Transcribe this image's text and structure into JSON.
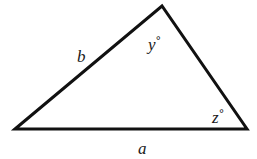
{
  "diagram": {
    "type": "triangle",
    "vertices": {
      "left": [
        15,
        129
      ],
      "top": [
        162,
        6
      ],
      "right": [
        247,
        129
      ]
    },
    "stroke_color": "#111111",
    "sides": {
      "a": {
        "label": "a",
        "position": "bottom"
      },
      "b": {
        "label": "b",
        "position": "left"
      }
    },
    "angles": {
      "y": {
        "label": "y",
        "symbol": "°",
        "vertex": "top"
      },
      "z": {
        "label": "z",
        "symbol": "°",
        "vertex": "right"
      }
    }
  }
}
